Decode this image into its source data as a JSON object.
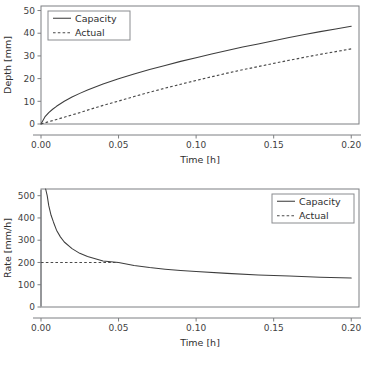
{
  "page": {
    "background_color": "#ffffff",
    "text_color": "#3a3a3a",
    "line_color": "#3d3d3d",
    "frame_color": "#7d7f82"
  },
  "chart_data": [
    {
      "id": "depth-vs-time",
      "type": "line",
      "title": "",
      "xlabel": "Time [h]",
      "ylabel": "Depth [mm]",
      "xlim": [
        0.0,
        0.205
      ],
      "ylim": [
        0,
        52
      ],
      "xticks": [
        0.0,
        0.05,
        0.1,
        0.15,
        0.2
      ],
      "xticklabels": [
        "0.00",
        "0.05",
        "0.10",
        "0.15",
        "0.20"
      ],
      "yticks": [
        0,
        10,
        20,
        30,
        40,
        50
      ],
      "yticklabels": [
        "0",
        "10",
        "20",
        "30",
        "40",
        "50"
      ],
      "grid": false,
      "legend_position": "upper left",
      "series": [
        {
          "name": "Capacity",
          "style": "solid",
          "x": [
            0.0,
            0.0025,
            0.005,
            0.0075,
            0.01,
            0.015,
            0.02,
            0.025,
            0.03,
            0.04,
            0.05,
            0.06,
            0.07,
            0.08,
            0.09,
            0.1,
            0.11,
            0.12,
            0.13,
            0.14,
            0.15,
            0.16,
            0.17,
            0.18,
            0.19,
            0.2
          ],
          "values": [
            0.0,
            3.1,
            5.0,
            6.5,
            7.8,
            10.0,
            11.9,
            13.5,
            15.0,
            17.6,
            19.9,
            22.0,
            24.0,
            25.8,
            27.6,
            29.2,
            30.8,
            32.4,
            33.9,
            35.3,
            36.7,
            38.1,
            39.4,
            40.7,
            41.9,
            43.1
          ]
        },
        {
          "name": "Actual",
          "style": "dashed",
          "x": [
            0.0,
            0.0025,
            0.005,
            0.0075,
            0.01,
            0.015,
            0.02,
            0.025,
            0.03,
            0.04,
            0.05,
            0.06,
            0.07,
            0.08,
            0.09,
            0.1,
            0.11,
            0.12,
            0.13,
            0.14,
            0.15,
            0.16,
            0.17,
            0.18,
            0.19,
            0.2
          ],
          "values": [
            0.0,
            0.5,
            1.0,
            1.5,
            2.0,
            3.0,
            4.0,
            5.0,
            6.1,
            8.2,
            10.1,
            12.1,
            14.0,
            15.8,
            17.5,
            19.2,
            20.8,
            22.4,
            23.9,
            25.3,
            26.7,
            28.1,
            29.4,
            30.7,
            31.9,
            33.1
          ]
        }
      ]
    },
    {
      "id": "rate-vs-time",
      "type": "line",
      "title": "",
      "xlabel": "Time [h]",
      "ylabel": "Rate [mm/h]",
      "xlim": [
        0.0,
        0.205
      ],
      "ylim": [
        0,
        530
      ],
      "xticks": [
        0.0,
        0.05,
        0.1,
        0.15,
        0.2
      ],
      "xticklabels": [
        "0.00",
        "0.05",
        "0.10",
        "0.15",
        "0.20"
      ],
      "yticks": [
        0,
        100,
        200,
        300,
        400,
        500
      ],
      "yticklabels": [
        "0",
        "100",
        "200",
        "300",
        "400",
        "500"
      ],
      "grid": false,
      "legend_position": "upper right",
      "annotations": [
        {
          "name": "t-zero-asymptote",
          "x": 0.0,
          "description": "vertical line at t = 0"
        }
      ],
      "series": [
        {
          "name": "Capacity",
          "style": "solid",
          "x": [
            0.003,
            0.004,
            0.005,
            0.0065,
            0.008,
            0.01,
            0.0125,
            0.015,
            0.02,
            0.025,
            0.03,
            0.04,
            0.05,
            0.06,
            0.07,
            0.08,
            0.09,
            0.1,
            0.12,
            0.14,
            0.16,
            0.18,
            0.2
          ],
          "values": [
            530,
            500,
            455,
            412,
            382,
            345,
            315,
            292,
            262,
            241,
            227,
            207,
            200,
            186,
            177,
            170,
            164,
            159,
            151,
            144,
            139,
            134,
            130
          ]
        },
        {
          "name": "Actual",
          "style": "dashed",
          "x": [
            0.0,
            0.05
          ],
          "values": [
            200,
            200
          ]
        }
      ]
    }
  ],
  "legend": {
    "capacity_label": "Capacity",
    "actual_label": "Actual"
  }
}
